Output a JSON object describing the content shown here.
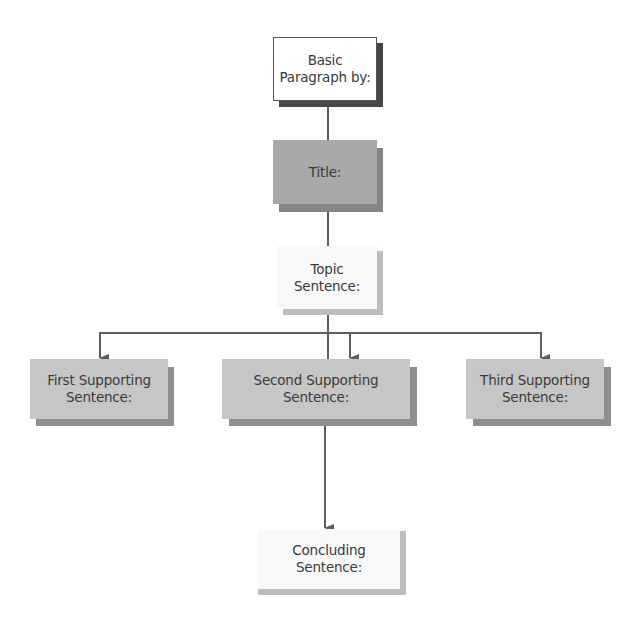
{
  "diagram": {
    "type": "flowchart",
    "colors": {
      "line": "#5e5e5e",
      "dark_box": "#a9a9a9",
      "dark_shadow": "#858585",
      "mid_box": "#c6c6c6",
      "mid_shadow": "#8e8e8e",
      "light_box": "#f8f8f8",
      "light_shadow": "#bdbdbd",
      "white_box": "#ffffff",
      "white_shadow": "#474747",
      "text": "#3a3a3a"
    },
    "nodes": [
      {
        "id": "basic",
        "label": "Basic\nParagraph by:"
      },
      {
        "id": "title",
        "label": "Title:"
      },
      {
        "id": "topic",
        "label": "Topic\nSentence:"
      },
      {
        "id": "first",
        "label": "First Supporting\nSentence:"
      },
      {
        "id": "second",
        "label": "Second Supporting\nSentence:"
      },
      {
        "id": "third",
        "label": "Third Supporting\nSentence:"
      },
      {
        "id": "concluding",
        "label": "Concluding\nSentence:"
      }
    ],
    "edges": [
      {
        "from": "basic",
        "to": "title",
        "arrow": false
      },
      {
        "from": "title",
        "to": "topic",
        "arrow": false
      },
      {
        "from": "topic",
        "to": "first",
        "arrow": true
      },
      {
        "from": "topic",
        "to": "second",
        "arrow": true
      },
      {
        "from": "topic",
        "to": "third",
        "arrow": true
      },
      {
        "from": "second",
        "to": "concluding",
        "arrow": true
      }
    ]
  }
}
